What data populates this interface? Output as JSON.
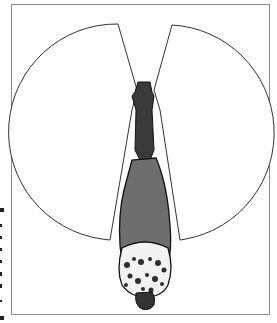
{
  "figure": {
    "colors": {
      "frame": "#8a8a8a",
      "vision_outline": "#333333",
      "horse_body": "#6b6b6b",
      "horse_dark": "#2e2e2e",
      "spots_bg": "#f2f2f2"
    }
  }
}
